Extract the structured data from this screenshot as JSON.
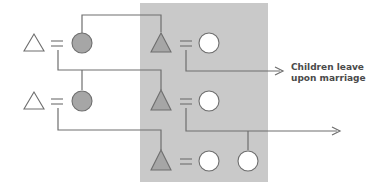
{
  "diagram": {
    "type": "kinship",
    "colors": {
      "background": "#ffffff",
      "highlight_box": "#c9c9c9",
      "filled_symbol": "#a6a6a6",
      "line": "#6e6e6e",
      "text": "#4a4a4a"
    },
    "legend": {
      "male": "triangle",
      "female": "circle",
      "marriage": "="
    },
    "generations": [
      {
        "row": 1,
        "outside_couple": {
          "male": "open",
          "female": "filled"
        },
        "inside_couple": {
          "male": "filled",
          "female": "open"
        }
      },
      {
        "row": 2,
        "outside_couple": {
          "male": "open",
          "female": "filled"
        },
        "inside_couple": {
          "male": "filled",
          "female": "open"
        }
      },
      {
        "row": 3,
        "inside_couple": {
          "male": "filled",
          "female": "open"
        },
        "daughter": "open"
      }
    ],
    "annotation": {
      "line1": "Children leave",
      "line2": "upon marriage"
    }
  }
}
